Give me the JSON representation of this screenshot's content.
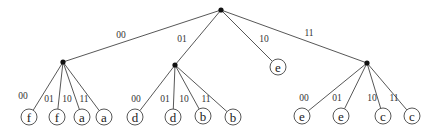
{
  "diagram": {
    "type": "tree",
    "root": {
      "id": "root",
      "x": 221,
      "y": 10
    },
    "internal_nodes": [
      {
        "id": "n00",
        "x": 63,
        "y": 62
      },
      {
        "id": "n01",
        "x": 175,
        "y": 65
      },
      {
        "id": "n11",
        "x": 367,
        "y": 63
      }
    ],
    "leaves": [
      {
        "id": "l000",
        "label": "f",
        "x": 29,
        "y": 117
      },
      {
        "id": "l001",
        "label": "f",
        "x": 57,
        "y": 117
      },
      {
        "id": "l010",
        "label": "a",
        "x": 82,
        "y": 117
      },
      {
        "id": "l011",
        "label": "a",
        "x": 104,
        "y": 117
      },
      {
        "id": "l100",
        "label": "d",
        "x": 135,
        "y": 117
      },
      {
        "id": "l101",
        "label": "d",
        "x": 173,
        "y": 117
      },
      {
        "id": "l110",
        "label": "b",
        "x": 203,
        "y": 116
      },
      {
        "id": "l111",
        "label": "b",
        "x": 233,
        "y": 117
      },
      {
        "id": "l2",
        "label": "e",
        "x": 278,
        "y": 67
      },
      {
        "id": "l300",
        "label": "e",
        "x": 302,
        "y": 116
      },
      {
        "id": "l301",
        "label": "e",
        "x": 341,
        "y": 116
      },
      {
        "id": "l310",
        "label": "c",
        "x": 383,
        "y": 116
      },
      {
        "id": "l311",
        "label": "c",
        "x": 412,
        "y": 116
      }
    ],
    "edges": [
      {
        "from": "root",
        "to": "n00",
        "label": "00",
        "lx": 121,
        "ly": 38
      },
      {
        "from": "root",
        "to": "n01",
        "label": "01",
        "lx": 182,
        "ly": 42
      },
      {
        "from": "root",
        "to": "l2",
        "label": "10",
        "lx": 264,
        "ly": 42
      },
      {
        "from": "root",
        "to": "n11",
        "label": "11",
        "lx": 309,
        "ly": 36
      },
      {
        "from": "n00",
        "to": "l000",
        "label": "00",
        "lx": 23,
        "ly": 99
      },
      {
        "from": "n00",
        "to": "l001",
        "label": "01",
        "lx": 49,
        "ly": 102
      },
      {
        "from": "n00",
        "to": "l010",
        "label": "10",
        "lx": 67,
        "ly": 102
      },
      {
        "from": "n00",
        "to": "l011",
        "label": "11",
        "lx": 84,
        "ly": 102
      },
      {
        "from": "n01",
        "to": "l100",
        "label": "00",
        "lx": 136,
        "ly": 102
      },
      {
        "from": "n01",
        "to": "l101",
        "label": "01",
        "lx": 165,
        "ly": 102
      },
      {
        "from": "n01",
        "to": "l110",
        "label": "10",
        "lx": 184,
        "ly": 102
      },
      {
        "from": "n01",
        "to": "l111",
        "label": "11",
        "lx": 206,
        "ly": 102
      },
      {
        "from": "n11",
        "to": "l300",
        "label": "00",
        "lx": 304,
        "ly": 101
      },
      {
        "from": "n11",
        "to": "l301",
        "label": "01",
        "lx": 337,
        "ly": 101
      },
      {
        "from": "n11",
        "to": "l310",
        "label": "10",
        "lx": 372,
        "ly": 101
      },
      {
        "from": "n11",
        "to": "l311",
        "label": "11",
        "lx": 394,
        "ly": 101
      }
    ]
  }
}
